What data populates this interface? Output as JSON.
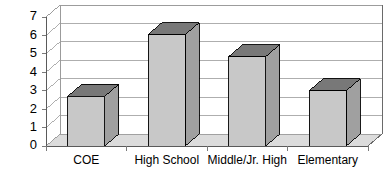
{
  "chart_data": {
    "type": "bar",
    "title": "",
    "subtitle": "",
    "xlabel": "",
    "ylabel": "",
    "categories": [
      "COE",
      "High School",
      "Middle/Jr. High",
      "Elementary"
    ],
    "values": [
      2.7,
      6.05,
      4.85,
      3.0
    ],
    "series": [
      {
        "name": "",
        "values": [
          2.7,
          6.05,
          4.85,
          3.0
        ]
      }
    ],
    "ylim": [
      0,
      7
    ],
    "ytick_labels": [
      "0",
      "1",
      "2",
      "3",
      "4",
      "5",
      "6",
      "7"
    ],
    "ytick_values": [
      0,
      1,
      2,
      3,
      4,
      5,
      6,
      7
    ],
    "xtick_labels": [
      "COE",
      "High School",
      "Middle/Jr. High",
      "Elementary"
    ],
    "grid": true,
    "grid_axis": "y",
    "legend": false,
    "legend_position": "none",
    "style": "3d-column",
    "annotations": []
  },
  "colors": {
    "background": "#ffffff",
    "plot_area": "#ffffff",
    "bar_front": "#c8c8c8",
    "bar_top": "#787878",
    "bar_side": "#a0a0a0",
    "bar_outline": "#000000",
    "gridline": "#9a9a9a",
    "axis": "#5a5a5a",
    "floor": "#dcdcdc",
    "back_wall": "#ffffff",
    "text": "#000000"
  },
  "axes": {
    "y_axis_label_0": "0",
    "y_axis_label_1": "1",
    "y_axis_label_2": "2",
    "y_axis_label_3": "3",
    "y_axis_label_4": "4",
    "y_axis_label_5": "5",
    "y_axis_label_6": "6",
    "y_axis_label_7": "7"
  },
  "categories": {
    "c0": "COE",
    "c1": "High School",
    "c2": "Middle/Jr. High",
    "c3": "Elementary"
  }
}
